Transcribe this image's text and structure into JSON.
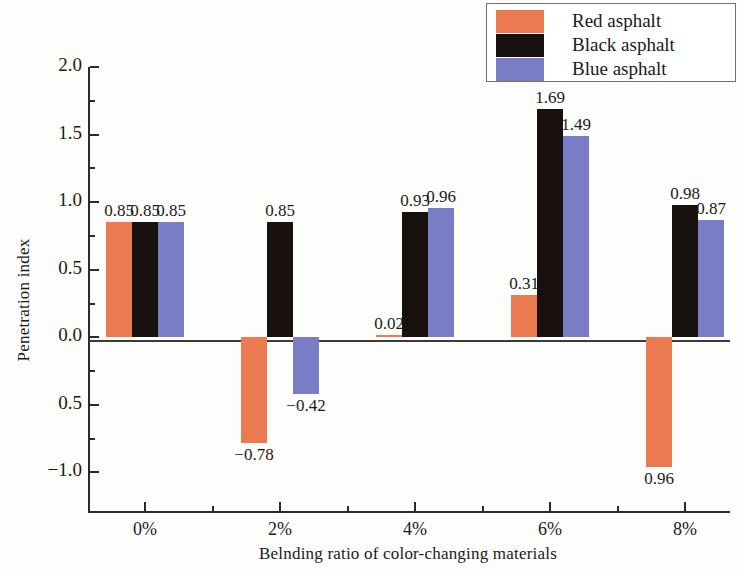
{
  "chart_data": {
    "type": "bar",
    "title": "",
    "xlabel": "Belnding ratio of color-changing materials",
    "ylabel": "Penetration index",
    "categories": [
      "0%",
      "2%",
      "4%",
      "6%",
      "8%"
    ],
    "series": [
      {
        "name": "Red asphalt",
        "color": "#ec7a50",
        "values": [
          0.85,
          -0.78,
          0.02,
          0.31,
          -0.96
        ],
        "labels": [
          "0.85",
          "−0.78",
          "0.02",
          "0.31",
          "0.96"
        ]
      },
      {
        "name": "Black asphalt",
        "color": "#17100f",
        "values": [
          0.85,
          0.85,
          0.93,
          1.69,
          0.98
        ],
        "labels": [
          "0.85",
          "0.85",
          "0.93",
          "1.69",
          "0.98"
        ]
      },
      {
        "name": "Blue asphalt",
        "color": "#787dc6",
        "values": [
          0.85,
          -0.42,
          0.96,
          1.49,
          0.87
        ],
        "labels": [
          "0.85",
          "−0.42",
          "0.96",
          "1.49",
          "0.87"
        ]
      }
    ],
    "ylim": [
      -1.3,
      2.0
    ],
    "yticks": [
      2.0,
      1.5,
      1.0,
      0.5,
      0.0,
      -0.5,
      -1.0
    ],
    "ytick_labels": [
      "2.0",
      "1.5",
      "1.0",
      "0.5",
      "0.0",
      "0.5",
      "−1.0"
    ],
    "minor_ticks": true,
    "grid": false,
    "legend_position": "top-right"
  },
  "legend": {
    "items": [
      {
        "label": "Red asphalt",
        "swatch": "red"
      },
      {
        "label": "Black asphalt",
        "swatch": "black"
      },
      {
        "label": "Blue asphalt",
        "swatch": "blue"
      }
    ]
  },
  "axes": {
    "y_title": "Penetration index",
    "x_title": "Belnding ratio of color-changing materials"
  }
}
